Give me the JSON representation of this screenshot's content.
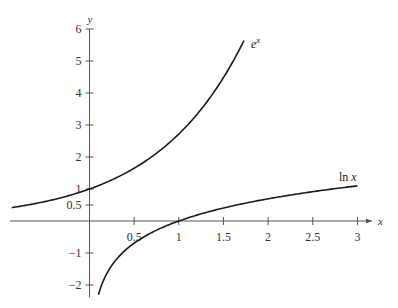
{
  "chart_data": {
    "type": "line",
    "title": "",
    "xlabel": "x",
    "ylabel": "y",
    "xlim": [
      -0.9,
      3.2
    ],
    "ylim": [
      -2.3,
      6.2
    ],
    "grid": false,
    "legend": null,
    "x_ticks": [
      {
        "value": 0.5,
        "label": "0.5"
      },
      {
        "value": 1,
        "label": "1"
      },
      {
        "value": 1.5,
        "label": "1.5"
      },
      {
        "value": 2,
        "label": "2"
      },
      {
        "value": 2.5,
        "label": "2.5"
      },
      {
        "value": 3,
        "label": "3"
      }
    ],
    "y_ticks": [
      {
        "value": -2,
        "label": "−2"
      },
      {
        "value": -1,
        "label": "−1"
      },
      {
        "value": 0.5,
        "label": "0.5"
      },
      {
        "value": 1,
        "label": "1"
      },
      {
        "value": 2,
        "label": "2"
      },
      {
        "value": 3,
        "label": "3"
      },
      {
        "value": 4,
        "label": "4"
      },
      {
        "value": 5,
        "label": "5"
      },
      {
        "value": 6,
        "label": "6"
      }
    ],
    "series": [
      {
        "name": "e^x",
        "label_base": "e",
        "label_sup": "x",
        "function": "exp",
        "x_range": [
          -0.87,
          1.73
        ],
        "sample_points": [
          {
            "x": -0.87,
            "y": 0.42
          },
          {
            "x": -0.5,
            "y": 0.61
          },
          {
            "x": 0,
            "y": 1.0
          },
          {
            "x": 0.5,
            "y": 1.65
          },
          {
            "x": 1,
            "y": 2.72
          },
          {
            "x": 1.5,
            "y": 4.48
          },
          {
            "x": 1.73,
            "y": 5.64
          }
        ]
      },
      {
        "name": "ln x",
        "label_base": "ln ",
        "label_sup": "x",
        "function": "log",
        "x_range": [
          0.1,
          3.0
        ],
        "sample_points": [
          {
            "x": 0.1,
            "y": -2.3
          },
          {
            "x": 0.5,
            "y": -0.69
          },
          {
            "x": 1,
            "y": 0.0
          },
          {
            "x": 1.5,
            "y": 0.41
          },
          {
            "x": 2,
            "y": 0.69
          },
          {
            "x": 2.5,
            "y": 0.92
          },
          {
            "x": 3,
            "y": 1.1
          }
        ]
      }
    ],
    "annotations": [
      {
        "text": "e^x",
        "near": {
          "x": 1.75,
          "y": 5.6
        }
      },
      {
        "text": "ln x",
        "near": {
          "x": 2.85,
          "y": 1.3
        }
      }
    ]
  },
  "layout": {
    "origin_px": [
      89.5,
      221
    ],
    "x_unit_px": 89.3,
    "y_unit_px": 32,
    "x_axis_px": [
      10,
      372
    ],
    "y_axis_px": [
      29,
      297
    ]
  }
}
